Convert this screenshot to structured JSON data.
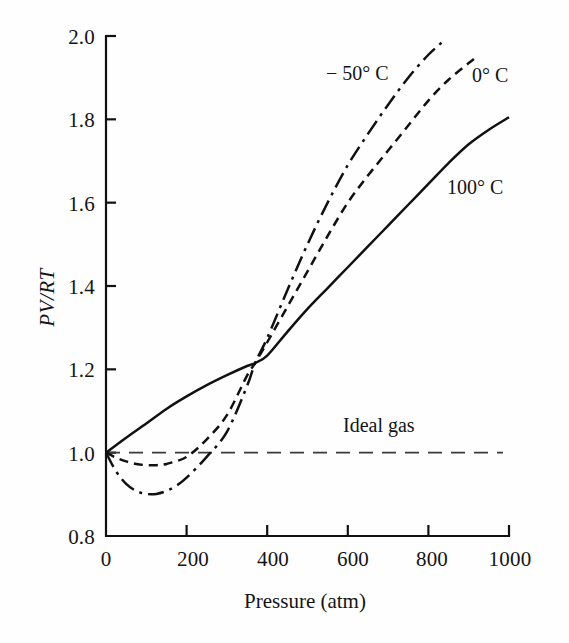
{
  "chart_data": {
    "type": "line",
    "title": "",
    "xlabel": "Pressure (atm)",
    "ylabel": "PV/RT",
    "xlim": [
      0,
      1000
    ],
    "ylim": [
      0.8,
      2.0
    ],
    "xticks": [
      "0",
      "200",
      "400",
      "600",
      "800",
      "1000"
    ],
    "xtick_values": [
      0,
      200,
      400,
      600,
      800,
      1000
    ],
    "yticks": [
      "0.8",
      "1.0",
      "1.2",
      "1.4",
      "1.6",
      "1.8",
      "2.0"
    ],
    "ytick_values": [
      0.8,
      1.0,
      1.2,
      1.4,
      1.6,
      1.8,
      2.0
    ],
    "grid": false,
    "legend_position": "inline-labels",
    "annotations": [
      {
        "text": "Ideal gas",
        "x": 600,
        "y": 1.04
      }
    ],
    "series": [
      {
        "name": "-50° C",
        "label": "− 50° C",
        "style": "dash-dot",
        "color": "#111111",
        "label_x": 560,
        "label_y": 1.88,
        "x": [
          0,
          25,
          50,
          75,
          100,
          125,
          150,
          175,
          200,
          250,
          300,
          350,
          370,
          400,
          450,
          500,
          550,
          600,
          650,
          700,
          750,
          800,
          840
        ],
        "y": [
          1.0,
          0.955,
          0.925,
          0.908,
          0.901,
          0.901,
          0.908,
          0.921,
          0.94,
          0.99,
          1.05,
          1.16,
          1.215,
          1.275,
          1.39,
          1.5,
          1.6,
          1.69,
          1.765,
          1.835,
          1.9,
          1.955,
          1.99
        ]
      },
      {
        "name": "0° C",
        "label": "0° C",
        "style": "dashed",
        "color": "#111111",
        "label_x": 925,
        "label_y": 1.855,
        "x": [
          0,
          25,
          50,
          75,
          100,
          125,
          150,
          200,
          250,
          300,
          350,
          370,
          400,
          450,
          500,
          550,
          600,
          650,
          700,
          750,
          800,
          850,
          900,
          920
        ],
        "y": [
          1.0,
          0.988,
          0.979,
          0.973,
          0.97,
          0.97,
          0.973,
          0.99,
          1.032,
          1.09,
          1.185,
          1.215,
          1.265,
          1.35,
          1.435,
          1.52,
          1.6,
          1.665,
          1.725,
          1.785,
          1.845,
          1.895,
          1.935,
          1.95
        ]
      },
      {
        "name": "100° C",
        "label": "100° C",
        "style": "solid",
        "color": "#111111",
        "label_x": 865,
        "label_y": 1.5,
        "x": [
          0,
          50,
          100,
          150,
          200,
          250,
          300,
          350,
          370,
          400,
          450,
          500,
          550,
          600,
          650,
          700,
          750,
          800,
          850,
          900,
          950,
          1000
        ],
        "y": [
          1.0,
          1.036,
          1.07,
          1.105,
          1.135,
          1.162,
          1.186,
          1.208,
          1.215,
          1.233,
          1.29,
          1.345,
          1.395,
          1.445,
          1.495,
          1.545,
          1.595,
          1.645,
          1.695,
          1.74,
          1.775,
          1.805
        ]
      },
      {
        "name": "Ideal gas",
        "label": "Ideal gas",
        "style": "long-dash",
        "color": "#3a3a3a",
        "x": [
          0,
          985
        ],
        "y": [
          1.0,
          1.0
        ]
      }
    ]
  },
  "axes": {
    "y_axis_name": "PV/RT",
    "x_axis_name": "Pressure (atm)"
  }
}
